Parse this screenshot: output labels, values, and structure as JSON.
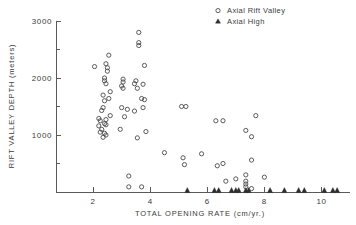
{
  "chart_data": {
    "type": "scatter",
    "title": "",
    "xlabel": "TOTAL OPENING RATE (cm/yr.)",
    "ylabel": "RIFT VALLEY DEPTH (meters)",
    "xlim": [
      0.7,
      11.0
    ],
    "ylim": [
      0,
      3000
    ],
    "xticks": [
      2,
      4,
      6,
      8,
      10
    ],
    "xticklabels": [
      "2",
      "4",
      "6",
      "8",
      "10"
    ],
    "yticks": [
      0,
      500,
      1000,
      1500,
      2000,
      2500,
      3000
    ],
    "yticklabels": [
      "",
      "",
      "1000",
      "",
      "2000",
      "",
      "3000"
    ],
    "ymajorticklabels": [
      "1000",
      "2000",
      "3000"
    ],
    "grid": false,
    "legend_position": "top-right",
    "series": [
      {
        "name": "Axial Rift Valley",
        "marker": "open-circle",
        "color": "#4a4a4a",
        "points": [
          [
            2.05,
            2200
          ],
          [
            2.55,
            2400
          ],
          [
            2.45,
            2250
          ],
          [
            2.5,
            2180
          ],
          [
            2.5,
            2120
          ],
          [
            2.4,
            2000
          ],
          [
            2.4,
            1950
          ],
          [
            2.45,
            1900
          ],
          [
            2.6,
            1760
          ],
          [
            2.35,
            1700
          ],
          [
            2.55,
            1640
          ],
          [
            2.4,
            1600
          ],
          [
            2.35,
            1480
          ],
          [
            2.3,
            1430
          ],
          [
            2.6,
            1340
          ],
          [
            2.2,
            1290
          ],
          [
            2.25,
            1250
          ],
          [
            2.45,
            1270
          ],
          [
            2.4,
            1200
          ],
          [
            2.45,
            1180
          ],
          [
            2.2,
            1160
          ],
          [
            2.3,
            1100
          ],
          [
            2.25,
            1050
          ],
          [
            2.4,
            1030
          ],
          [
            2.45,
            1000
          ],
          [
            2.35,
            960
          ],
          [
            3.05,
            1980
          ],
          [
            3.05,
            1930
          ],
          [
            3.0,
            1860
          ],
          [
            3.05,
            1820
          ],
          [
            3.0,
            1480
          ],
          [
            3.2,
            1450
          ],
          [
            3.1,
            1320
          ],
          [
            2.95,
            1100
          ],
          [
            3.25,
            280
          ],
          [
            3.25,
            90
          ],
          [
            3.6,
            2800
          ],
          [
            3.6,
            2620
          ],
          [
            3.6,
            2570
          ],
          [
            3.8,
            2220
          ],
          [
            3.5,
            1950
          ],
          [
            3.45,
            1900
          ],
          [
            3.75,
            1890
          ],
          [
            3.55,
            1820
          ],
          [
            3.7,
            1640
          ],
          [
            3.8,
            1620
          ],
          [
            3.45,
            1420
          ],
          [
            3.75,
            1480
          ],
          [
            3.85,
            1060
          ],
          [
            3.55,
            950
          ],
          [
            3.7,
            90
          ],
          [
            4.5,
            690
          ],
          [
            5.1,
            1500
          ],
          [
            5.25,
            1500
          ],
          [
            5.15,
            600
          ],
          [
            5.2,
            480
          ],
          [
            5.8,
            670
          ],
          [
            6.3,
            1250
          ],
          [
            6.55,
            1250
          ],
          [
            6.35,
            460
          ],
          [
            6.55,
            500
          ],
          [
            6.65,
            190
          ],
          [
            7.0,
            230
          ],
          [
            7.35,
            1080
          ],
          [
            7.55,
            970
          ],
          [
            7.7,
            1340
          ],
          [
            7.55,
            560
          ],
          [
            7.35,
            300
          ],
          [
            7.35,
            190
          ],
          [
            7.35,
            140
          ],
          [
            7.35,
            90
          ],
          [
            7.55,
            60
          ],
          [
            8.0,
            260
          ]
        ]
      },
      {
        "name": "Axial High",
        "marker": "filled-triangle",
        "color": "#2e2e2e",
        "points": [
          [
            5.3,
            0
          ],
          [
            6.25,
            0
          ],
          [
            6.4,
            0
          ],
          [
            6.85,
            0
          ],
          [
            7.0,
            0
          ],
          [
            7.1,
            0
          ],
          [
            7.35,
            0
          ],
          [
            7.45,
            0
          ],
          [
            8.2,
            0
          ],
          [
            8.7,
            0
          ],
          [
            9.2,
            0
          ],
          [
            9.4,
            0
          ],
          [
            10.1,
            0
          ],
          [
            10.4,
            0
          ],
          [
            10.55,
            0
          ]
        ]
      }
    ]
  },
  "legend": {
    "items": [
      {
        "label": "Axial Rift Valley",
        "marker": "open-circle"
      },
      {
        "label": "Axial High",
        "marker": "filled-triangle"
      }
    ]
  },
  "axes": {
    "x_title": "TOTAL OPENING RATE (cm/yr.)",
    "y_title": "RIFT VALLEY DEPTH (meters)"
  }
}
